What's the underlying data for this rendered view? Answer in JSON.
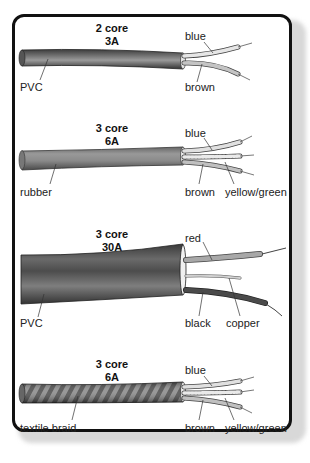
{
  "figure": {
    "frame_color": "#111111",
    "cables": [
      {
        "id": "cable-1",
        "cores_label": "2 core",
        "rating_label": "3A",
        "sheath_label": "PVC",
        "sheath_color": "#585858",
        "wire_labels": [
          "blue",
          "brown"
        ],
        "wire_colors": [
          "#d6d6d6",
          "#bdbdbd"
        ]
      },
      {
        "id": "cable-2",
        "cores_label": "3 core",
        "rating_label": "6A",
        "sheath_label": "rubber",
        "sheath_color": "#8a8a8a",
        "wire_labels": [
          "blue",
          "brown",
          "yellow/green"
        ],
        "wire_colors": [
          "#d6d6d6",
          "#bdbdbd",
          "#e4e4e4"
        ]
      },
      {
        "id": "cable-3",
        "cores_label": "3 core",
        "rating_label": "30A",
        "sheath_label": "PVC",
        "sheath_color": "#5a5a5a",
        "wire_labels": [
          "red",
          "black",
          "copper"
        ],
        "wire_colors": [
          "#a8a8a8",
          "#3a3a3a",
          "#c8c8c8"
        ]
      },
      {
        "id": "cable-4",
        "cores_label": "3 core",
        "rating_label": "6A",
        "sheath_label": "textile braid",
        "sheath_color": "#6a6a6a",
        "wire_labels": [
          "blue",
          "brown",
          "yellow/green"
        ],
        "wire_colors": [
          "#d6d6d6",
          "#bdbdbd",
          "#e4e4e4"
        ]
      }
    ]
  }
}
